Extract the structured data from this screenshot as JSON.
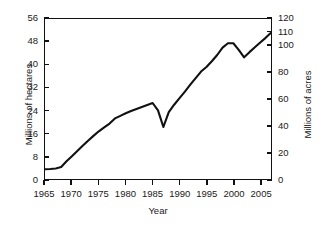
{
  "chart_data": {
    "type": "line",
    "title": "",
    "xlabel": "Year",
    "ylabel": "Millions of hectares",
    "ylabel_right": "Millions of acres",
    "xlim": [
      1965,
      2007
    ],
    "ylim": [
      0,
      56
    ],
    "ylim_right": [
      0,
      120
    ],
    "grid": false,
    "legend": null,
    "line_color": "#111111",
    "xticks": [
      1965,
      1970,
      1975,
      1980,
      1985,
      1990,
      1995,
      2000,
      2005
    ],
    "xtick_labels": [
      "1965",
      "1970",
      "1975",
      "1980",
      "1985",
      "1990",
      "1995",
      "2000",
      "2005"
    ],
    "yticks_left": [
      0,
      8,
      16,
      24,
      32,
      40,
      48,
      56
    ],
    "ytick_labels_left": [
      "0",
      "8",
      "16",
      "24",
      "32",
      "40",
      "48",
      "56"
    ],
    "yticks_right": [
      0,
      20,
      40,
      60,
      80,
      100,
      110,
      120
    ],
    "ytick_labels_right": [
      "0",
      "20",
      "40",
      "60",
      "80",
      "100",
      "110",
      "120"
    ],
    "series": [
      {
        "name": "Area",
        "x": [
          1965,
          1966,
          1967,
          1968,
          1969,
          1970,
          1971,
          1972,
          1973,
          1974,
          1975,
          1976,
          1977,
          1978,
          1979,
          1980,
          1981,
          1982,
          1983,
          1984,
          1985,
          1986,
          1987,
          1988,
          1989,
          1990,
          1991,
          1992,
          1993,
          1994,
          1995,
          1996,
          1997,
          1998,
          1999,
          2000,
          2001,
          2002,
          2003,
          2004,
          2005,
          2006,
          2007
        ],
        "values": [
          3.4,
          3.5,
          3.7,
          4.2,
          6.2,
          8.0,
          9.8,
          11.6,
          13.4,
          15.1,
          16.7,
          18.1,
          19.4,
          21.2,
          22.1,
          23.0,
          23.8,
          24.5,
          25.2,
          25.9,
          26.6,
          24.0,
          18.2,
          23.4,
          26.0,
          28.3,
          30.6,
          33.0,
          35.3,
          37.6,
          39.2,
          41.2,
          43.4,
          46.0,
          47.5,
          47.5,
          45.2,
          42.6,
          44.4,
          46.1,
          47.8,
          49.4,
          51.2
        ]
      }
    ]
  }
}
